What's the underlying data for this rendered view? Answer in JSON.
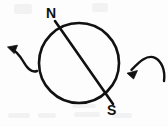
{
  "figure": {
    "background_color": "#fdfdfd",
    "stroke_color": "#111111",
    "width": 168,
    "height": 127,
    "labels": {
      "north_pole": "N",
      "south_pole": "S"
    },
    "elements": {
      "circle_name": "globe-circle",
      "axis_name": "rotation-axis-line",
      "left_arrow_name": "left-curved-arrow",
      "right_arrow_name": "right-curved-arrow"
    },
    "geometry": {
      "circle": {
        "cx": 79,
        "cy": 63,
        "r": 40,
        "stroke_width": 2.6
      },
      "axis_line": {
        "x1": 55,
        "y1": 21,
        "x2": 113,
        "y2": 104,
        "stroke_width": 2.6
      },
      "left_arrow": {
        "path": "M 37 71 C 31 73, 27 68, 23 61 C 20 56, 16 51, 11 49",
        "head_tip": {
          "x": 8,
          "y": 47
        },
        "stroke_width": 2.4
      },
      "right_arrow": {
        "path": "M 164 80 C 165 70, 161 61, 155 58 C 147 54, 139 62, 131 70",
        "head_tip": {
          "x": 127,
          "y": 73
        },
        "stroke_width": 2.4
      }
    }
  }
}
